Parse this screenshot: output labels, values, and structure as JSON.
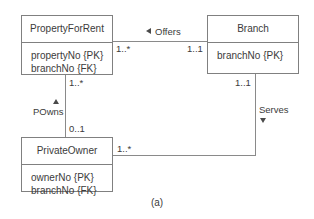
{
  "diagram": {
    "caption": "(a)",
    "line_color": "#8a8a8a",
    "text_color": "#3b3b3b",
    "classes": [
      {
        "id": "property-for-rent",
        "name": "PropertyForRent",
        "attributes": [
          "propertyNo {PK}",
          "branchNo {FK}"
        ]
      },
      {
        "id": "branch",
        "name": "Branch",
        "attributes": [
          "branchNo {PK}"
        ]
      },
      {
        "id": "private-owner",
        "name": "PrivateOwner",
        "attributes": [
          "ownerNo {PK}",
          "branchNo {FK}"
        ]
      }
    ],
    "associations": [
      {
        "id": "offers",
        "label": "Offers",
        "direction": "left",
        "source_multiplicity": "1..*",
        "target_multiplicity": "1..1"
      },
      {
        "id": "powns",
        "label": "POwns",
        "direction": "up",
        "source_multiplicity": "1..*",
        "target_multiplicity": "0..1"
      },
      {
        "id": "serves",
        "label": "Serves",
        "direction": "down",
        "source_multiplicity": "1..1",
        "target_multiplicity": "1..*"
      }
    ]
  }
}
